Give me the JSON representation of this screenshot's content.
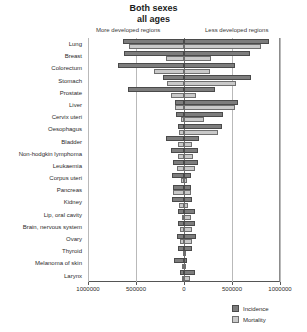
{
  "chart_data": {
    "type": "bar",
    "title": "Both sexes",
    "subtitle": "all ages",
    "xlabel": "",
    "ylabel": "",
    "orientation": "horizontal-diverging",
    "grid": true,
    "legend_position": "bottom-right",
    "left_panel_label": "More developed regions",
    "right_panel_label": "Less developed regions",
    "xlim": [
      -1000000,
      1000000
    ],
    "xticks": [
      -1000000,
      -500000,
      0,
      500000,
      1000000
    ],
    "xtick_labels": [
      "1000000",
      "500000",
      "0",
      "500000",
      "1000000"
    ],
    "series": [
      {
        "name": "Incidence",
        "color": "#7d7d7d"
      },
      {
        "name": "Mortality",
        "color": "#c9c9c9"
      }
    ],
    "categories": [
      "Lung",
      "Breast",
      "Colorectum",
      "Stomach",
      "Prostate",
      "Liver",
      "Cervix uteri",
      "Oesophagus",
      "Bladder",
      "Non-hodgkin lymphoma",
      "Leukaemia",
      "Corpus uteri",
      "Pancreas",
      "Kidney",
      "Lip, oral cavity",
      "Brain, nervous system",
      "Ovary",
      "Thyroid",
      "Melanoma of skin",
      "Larynx"
    ],
    "rows": [
      {
        "category": "Lung",
        "more_incidence": 640000,
        "less_incidence": 890000,
        "more_mortality": 570000,
        "less_mortality": 800000
      },
      {
        "category": "Breast",
        "more_incidence": 630000,
        "less_incidence": 690000,
        "more_mortality": 190000,
        "less_mortality": 280000
      },
      {
        "category": "Colorectum",
        "more_incidence": 690000,
        "less_incidence": 530000,
        "more_mortality": 310000,
        "less_mortality": 270000
      },
      {
        "category": "Stomach",
        "more_incidence": 220000,
        "less_incidence": 700000,
        "more_mortality": 180000,
        "less_mortality": 540000
      },
      {
        "category": "Prostate",
        "more_incidence": 580000,
        "less_incidence": 320000,
        "more_mortality": 140000,
        "less_mortality": 120000
      },
      {
        "category": "Liver",
        "more_incidence": 90000,
        "less_incidence": 560000,
        "more_mortality": 90000,
        "less_mortality": 530000
      },
      {
        "category": "Cervix uteri",
        "more_incidence": 80000,
        "less_incidence": 410000,
        "more_mortality": 30000,
        "less_mortality": 210000
      },
      {
        "category": "Oesophagus",
        "more_incidence": 60000,
        "less_incidence": 400000,
        "more_mortality": 50000,
        "less_mortality": 350000
      },
      {
        "category": "Bladder",
        "more_incidence": 190000,
        "less_incidence": 160000,
        "more_mortality": 60000,
        "less_mortality": 80000
      },
      {
        "category": "Non-hodgkin lymphoma",
        "more_incidence": 140000,
        "less_incidence": 150000,
        "more_mortality": 60000,
        "less_mortality": 90000
      },
      {
        "category": "Leukaemia",
        "more_incidence": 110000,
        "less_incidence": 150000,
        "more_mortality": 70000,
        "less_mortality": 110000
      },
      {
        "category": "Corpus uteri",
        "more_incidence": 130000,
        "less_incidence": 70000,
        "more_mortality": 30000,
        "less_mortality": 30000
      },
      {
        "category": "Pancreas",
        "more_incidence": 110000,
        "less_incidence": 70000,
        "more_mortality": 110000,
        "less_mortality": 70000
      },
      {
        "category": "Kidney",
        "more_incidence": 120000,
        "less_incidence": 80000,
        "more_mortality": 50000,
        "less_mortality": 40000
      },
      {
        "category": "Lip, oral cavity",
        "more_incidence": 60000,
        "less_incidence": 110000,
        "more_mortality": 20000,
        "less_mortality": 70000
      },
      {
        "category": "Brain, nervous system",
        "more_incidence": 60000,
        "less_incidence": 110000,
        "more_mortality": 40000,
        "less_mortality": 80000
      },
      {
        "category": "Ovary",
        "more_incidence": 70000,
        "less_incidence": 130000,
        "more_mortality": 40000,
        "less_mortality": 80000
      },
      {
        "category": "Thyroid",
        "more_incidence": 60000,
        "less_incidence": 80000,
        "more_mortality": 10000,
        "less_mortality": 20000
      },
      {
        "category": "Melanoma of skin",
        "more_incidence": 100000,
        "less_incidence": 30000,
        "more_mortality": 20000,
        "less_mortality": 20000
      },
      {
        "category": "Larynx",
        "more_incidence": 40000,
        "less_incidence": 110000,
        "more_mortality": 20000,
        "less_mortality": 60000
      }
    ]
  },
  "legend": {
    "items": [
      {
        "label": "Incidence",
        "swatch": "incidence-swatch"
      },
      {
        "label": "Mortality",
        "swatch": "mortality-swatch"
      }
    ]
  }
}
